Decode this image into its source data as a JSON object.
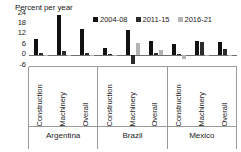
{
  "chart_data": {
    "type": "bar",
    "title": "Percent per year",
    "xlabel": "",
    "ylabel": "Percent per year",
    "ylim": [
      -6,
      24
    ],
    "yticks": [
      24,
      18,
      12,
      6,
      0,
      -6
    ],
    "grid": false,
    "legend_position": "top-right",
    "orientation": "vertical",
    "grouping": "clustered",
    "categories": [
      "Construction",
      "Machinery",
      "Overall",
      "Construction",
      "Machinery",
      "Overall",
      "Construction",
      "Machinery",
      "Overall"
    ],
    "supergroups": [
      {
        "label": "Argentina",
        "categories": [
          "Construction",
          "Machinery",
          "Overall"
        ]
      },
      {
        "label": "Brazil",
        "categories": [
          "Construction",
          "Machinery",
          "Overall"
        ]
      },
      {
        "label": "Mexico",
        "categories": [
          "Construction",
          "Machinery",
          "Overall"
        ]
      }
    ],
    "series": [
      {
        "name": "2004-08",
        "color": "#111111",
        "values": [
          9.0,
          23.0,
          15.0,
          4.0,
          14.0,
          8.0,
          6.0,
          8.0,
          7.0
        ]
      },
      {
        "name": "2011-15",
        "color": "#2b2b2b",
        "values": [
          0.8,
          2.0,
          1.0,
          0.5,
          -5.5,
          0.8,
          0.5,
          7.5,
          3.5
        ]
      },
      {
        "name": "2016-21",
        "color": "#b4b4b4",
        "values": [
          -0.3,
          -0.5,
          -0.4,
          -0.5,
          6.5,
          2.5,
          -2.5,
          -0.8,
          -1.0
        ]
      }
    ]
  },
  "legend": {
    "items": [
      {
        "label": "2004-08",
        "color": "#111111"
      },
      {
        "label": "2011-15",
        "color": "#2b2b2b"
      },
      {
        "label": "2016-21",
        "color": "#b4b4b4"
      }
    ]
  },
  "axis": {
    "title": "Percent per year",
    "y_ticks": [
      "24",
      "18",
      "12",
      "6",
      "0",
      "-6"
    ]
  }
}
